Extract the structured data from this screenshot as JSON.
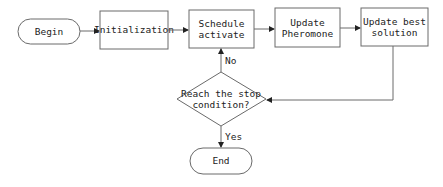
{
  "diagram": {
    "type": "flowchart",
    "nodes": {
      "begin": {
        "label": "Begin",
        "shape": "terminal"
      },
      "init": {
        "label": "Initialization",
        "shape": "process"
      },
      "schedule": {
        "line1": "Schedule",
        "line2": "activate",
        "shape": "process"
      },
      "pheromone": {
        "line1": "Update",
        "line2": "Pheromone",
        "shape": "process"
      },
      "best": {
        "line1": "Update best",
        "line2": "solution",
        "shape": "process"
      },
      "decision": {
        "line1": "Reach the stop",
        "line2": "condition?",
        "shape": "decision"
      },
      "end": {
        "label": "End",
        "shape": "terminal"
      }
    },
    "edges": {
      "no_label": "No",
      "yes_label": "Yes"
    },
    "colors": {
      "stroke": "#6a6a6a",
      "text": "#222222",
      "background": "#ffffff"
    }
  }
}
